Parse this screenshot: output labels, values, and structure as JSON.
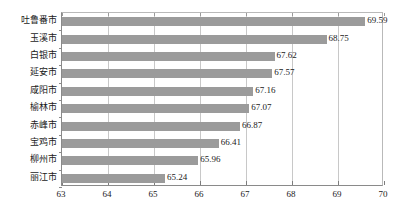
{
  "chart_data": {
    "type": "bar",
    "orientation": "horizontal",
    "title": "",
    "xlabel": "",
    "ylabel": "",
    "xlim": [
      63,
      70
    ],
    "xticks": [
      63,
      64,
      65,
      66,
      67,
      68,
      69,
      70
    ],
    "grid": true,
    "legend": false,
    "bar_color": "#9b9b9b",
    "categories": [
      "吐鲁番市",
      "玉溪市",
      "白银市",
      "延安市",
      "咸阳市",
      "榆林市",
      "赤峰市",
      "宝鸡市",
      "柳州市",
      "丽江市"
    ],
    "values": [
      69.59,
      68.75,
      67.62,
      67.57,
      67.16,
      67.07,
      66.87,
      66.41,
      65.96,
      65.24
    ],
    "data_labels": [
      "69.59",
      "68.75",
      "67.62",
      "67.57",
      "67.16",
      "67.07",
      "66.87",
      "66.41",
      "65.96",
      "65.24"
    ],
    "tick_labels": [
      "63",
      "64",
      "65",
      "66",
      "67",
      "68",
      "69",
      "70"
    ]
  }
}
